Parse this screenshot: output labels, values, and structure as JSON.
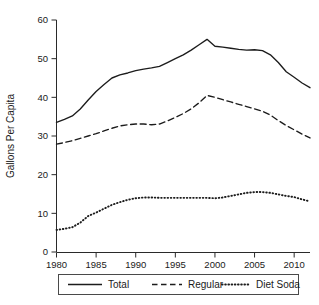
{
  "chart_data": {
    "type": "line",
    "title": "",
    "subtitle": "",
    "xlabel": "",
    "ylabel": "Gallons Per Capita",
    "xlim": [
      1980,
      2012
    ],
    "ylim": [
      0,
      60
    ],
    "grid": false,
    "legend_position": "bottom",
    "x_ticks": [
      1980,
      1985,
      1990,
      1995,
      2000,
      2005,
      2010
    ],
    "y_ticks": [
      0,
      10,
      20,
      30,
      40,
      50,
      60
    ],
    "x": [
      1980,
      1981,
      1982,
      1983,
      1984,
      1985,
      1986,
      1987,
      1988,
      1989,
      1990,
      1991,
      1992,
      1993,
      1994,
      1995,
      1996,
      1997,
      1998,
      1999,
      2000,
      2001,
      2002,
      2003,
      2004,
      2005,
      2006,
      2007,
      2008,
      2009,
      2010,
      2011,
      2012
    ],
    "series": [
      {
        "name": "Total",
        "style": "solid",
        "values": [
          33.5,
          34.3,
          35.2,
          37.0,
          39.3,
          41.5,
          43.3,
          45.0,
          45.8,
          46.3,
          46.9,
          47.3,
          47.6,
          48.0,
          49.0,
          50.0,
          51.0,
          52.2,
          53.6,
          55.0,
          53.2,
          53.0,
          52.7,
          52.4,
          52.2,
          52.3,
          52.1,
          51.0,
          49.0,
          46.6,
          45.2,
          43.7,
          42.5
        ]
      },
      {
        "name": "Regular",
        "style": "dashed",
        "values": [
          27.9,
          28.3,
          28.8,
          29.4,
          30.0,
          30.6,
          31.3,
          32.0,
          32.6,
          32.9,
          33.1,
          33.1,
          32.9,
          33.1,
          33.9,
          34.8,
          35.8,
          37.0,
          38.6,
          40.5,
          40.0,
          39.4,
          38.8,
          38.2,
          37.6,
          37.0,
          36.4,
          35.4,
          34.0,
          32.7,
          31.6,
          30.5,
          29.5
        ]
      },
      {
        "name": "Diet Soda",
        "style": "dotted",
        "values": [
          5.7,
          6.0,
          6.4,
          7.6,
          9.3,
          10.2,
          11.2,
          12.2,
          12.9,
          13.5,
          13.9,
          14.1,
          14.1,
          14.0,
          14.0,
          14.0,
          14.0,
          14.0,
          14.0,
          14.0,
          13.9,
          14.1,
          14.5,
          14.9,
          15.3,
          15.5,
          15.5,
          15.3,
          14.9,
          14.5,
          14.2,
          13.6,
          13.1
        ]
      }
    ]
  },
  "axes": {
    "y_title": "Gallons Per Capita"
  },
  "legend": {
    "items": [
      {
        "label": "Total",
        "style": "solid"
      },
      {
        "label": "Regular",
        "style": "dashed"
      },
      {
        "label": "Diet Soda",
        "style": "dotted"
      }
    ]
  }
}
